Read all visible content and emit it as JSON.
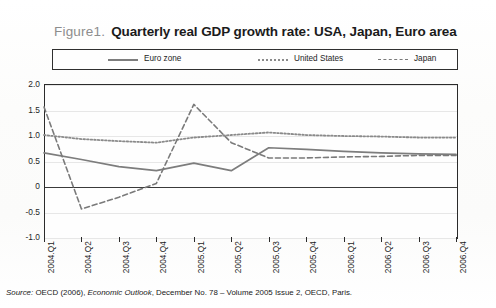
{
  "figure": {
    "label": "Figure1.",
    "title": "Quarterly real GDP growth rate: USA, Japan, Euro area"
  },
  "legend": {
    "items": [
      {
        "label": "Euro zone",
        "style": "solid"
      },
      {
        "label": "United States",
        "style": "dotted"
      },
      {
        "label": "Japan",
        "style": "dash-dot"
      }
    ]
  },
  "source": {
    "prefix": "Source:",
    "text_before": " OECD (2006), ",
    "italic": "Economic Outlook",
    "text_after": ", December No. 78 – Volume 2005 Issue 2, OECD, Paris."
  },
  "chart_data": {
    "type": "line",
    "title": "Quarterly real GDP growth rate: USA, Japan, Euro area",
    "xlabel": "",
    "ylabel": "",
    "categories": [
      "2004.Q1",
      "2004.Q2",
      "2004.Q3",
      "2004.Q4",
      "2005.Q1",
      "2005.Q2",
      "2005.Q3",
      "2005.Q4",
      "2006.Q1",
      "2006.Q2",
      "2006.Q3",
      "2006.Q4"
    ],
    "ylim": [
      -1.0,
      2.0
    ],
    "yticks": [
      2.0,
      1.5,
      1.0,
      0.5,
      0,
      -0.5,
      -1.0
    ],
    "ytick_labels": [
      "2.0",
      "1.5",
      "1.0",
      "0.5",
      "0",
      "-0.5",
      "-1.0"
    ],
    "grid": true,
    "legend_position": "top",
    "zero_line": 0,
    "series": [
      {
        "name": "Euro zone",
        "style": "solid",
        "color": "#7d7d7d",
        "values": [
          0.65,
          0.52,
          0.38,
          0.3,
          0.45,
          0.3,
          0.75,
          0.72,
          0.68,
          0.65,
          0.63,
          0.62
        ]
      },
      {
        "name": "United States",
        "style": "dotted",
        "color": "#8a8a8a",
        "values": [
          1.0,
          0.92,
          0.88,
          0.85,
          0.95,
          1.0,
          1.05,
          1.0,
          0.98,
          0.97,
          0.95,
          0.95
        ]
      },
      {
        "name": "Japan",
        "style": "dash-dot",
        "color": "#7a7a7a",
        "values": [
          1.55,
          -0.45,
          -0.22,
          0.05,
          1.6,
          0.85,
          0.55,
          0.55,
          0.57,
          0.58,
          0.6,
          0.6
        ]
      }
    ]
  }
}
